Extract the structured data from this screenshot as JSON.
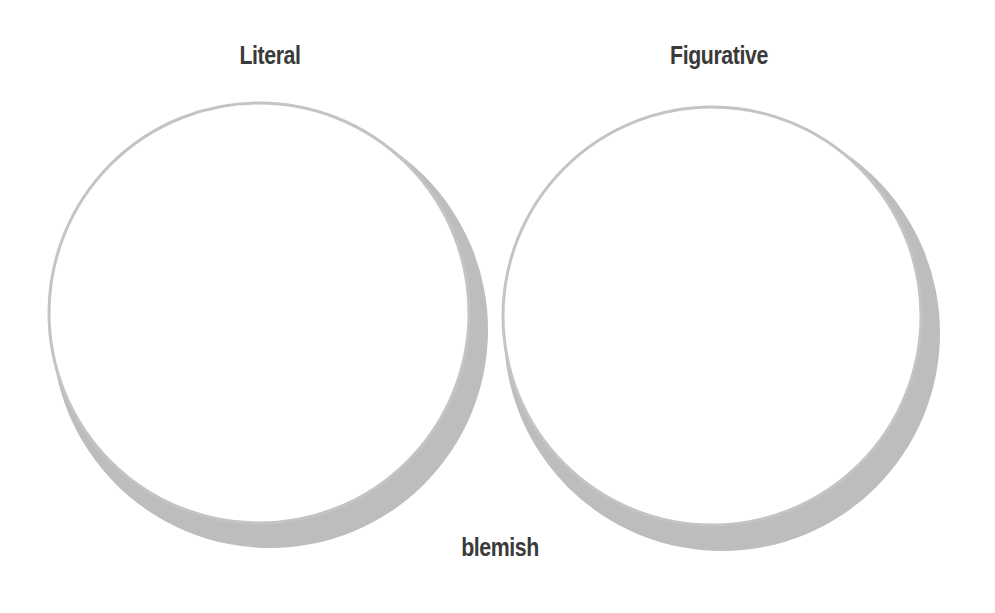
{
  "diagram": {
    "type": "two-circle comparison (moon/crescent style)",
    "circles": [
      {
        "label": "Literal",
        "position": "left"
      },
      {
        "label": "Figurative",
        "position": "right"
      }
    ],
    "term": "blemish"
  },
  "colors": {
    "background": "#ffffff",
    "circle_fill": "#ffffff",
    "circle_outline": "#c2c2c2",
    "shadow": "#bdbdbd",
    "text": "#3a3a3a"
  }
}
